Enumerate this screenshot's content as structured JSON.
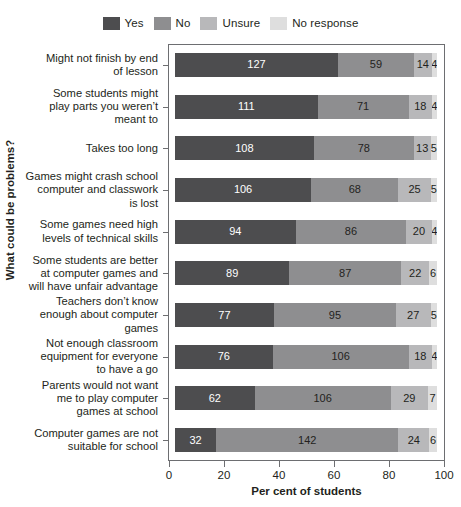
{
  "chart_data": {
    "type": "bar",
    "subtype": "horizontal-stacked-100",
    "title": "",
    "xlabel": "Per cent of students",
    "ylabel": "What could be problems?",
    "xlim": [
      0,
      100
    ],
    "xticks": [
      0,
      20,
      40,
      60,
      80,
      100
    ],
    "grid": false,
    "legend_position": "top",
    "value_unit": "count",
    "categories": [
      "Might not finish by end of lesson",
      "Some students might play parts you weren’t meant to",
      "Takes too long",
      "Games might crash school computer and classwork is lost",
      "Some games need high levels of technical skills",
      "Some students are better at computer games and will have unfair advantage",
      "Teachers don’t know enough about computer games",
      "Not enough classroom equipment for everyone to have a go",
      "Parents would not want me to play computer games at school",
      "Computer games are not suitable for school"
    ],
    "series": [
      {
        "name": "Yes",
        "color": "#4d4d4f",
        "values": [
          127,
          111,
          108,
          106,
          94,
          89,
          77,
          76,
          62,
          32
        ]
      },
      {
        "name": "No",
        "color": "#8e8e90",
        "values": [
          59,
          71,
          78,
          68,
          86,
          87,
          95,
          106,
          106,
          142
        ]
      },
      {
        "name": "Unsure",
        "color": "#b8b8ba",
        "values": [
          14,
          18,
          13,
          25,
          20,
          22,
          27,
          18,
          29,
          24
        ]
      },
      {
        "name": "No response",
        "color": "#dedede",
        "values": [
          4,
          4,
          5,
          5,
          4,
          6,
          5,
          4,
          7,
          6
        ]
      }
    ]
  },
  "legend": {
    "items": [
      {
        "label": "Yes",
        "color": "#4d4d4f"
      },
      {
        "label": "No",
        "color": "#8e8e90"
      },
      {
        "label": "Unsure",
        "color": "#b8b8ba"
      },
      {
        "label": "No response",
        "color": "#dedede"
      }
    ]
  },
  "category_labels": [
    [
      "Might not finish by end",
      "of lesson"
    ],
    [
      "Some students might",
      "play parts you weren’t",
      "meant to"
    ],
    [
      "Takes too long"
    ],
    [
      "Games might crash school",
      "computer and classwork",
      "is lost"
    ],
    [
      "Some games need high",
      "levels of technical skills"
    ],
    [
      "Some students are better",
      "at computer games and",
      "will have unfair advantage"
    ],
    [
      "Teachers don’t know",
      "enough about computer",
      "games"
    ],
    [
      "Not enough classroom",
      "equipment for everyone",
      "to have a go"
    ],
    [
      "Parents would not want",
      "me to play computer",
      "games at school"
    ],
    [
      "Computer games are not",
      "suitable for school"
    ]
  ],
  "axes": {
    "x_title": "Per cent of students",
    "y_title": "What could be problems?",
    "x_tick_labels": [
      "0",
      "20",
      "40",
      "60",
      "80",
      "100"
    ]
  }
}
